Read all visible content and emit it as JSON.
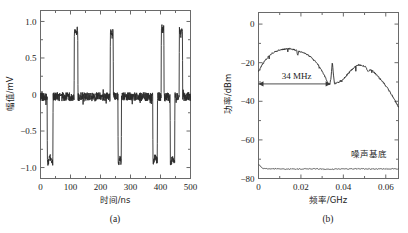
{
  "figure": {
    "background": "#ffffff",
    "trace_color": "#2a2a2a",
    "axis_color": "#6a6a6a"
  },
  "panels": [
    {
      "id": "a",
      "caption": "(a)",
      "xlabel": "时间/ns",
      "ylabel": "幅值/mV",
      "xticks": [
        "0",
        "100",
        "200",
        "300",
        "400",
        "500"
      ],
      "yticks": [
        "1.0",
        "0.5",
        "0",
        "-0.5",
        "-1.0"
      ]
    },
    {
      "id": "b",
      "caption": "(b)",
      "xlabel": "频率/GHz",
      "ylabel": "功率/dBm",
      "xticks": [
        "0",
        "0.02",
        "0.04",
        "0.06"
      ],
      "yticks": [
        "0",
        "-20",
        "-40",
        "-60",
        "-80"
      ],
      "bandwidth_label": "34 MHz",
      "noise_floor_label": "噪声基底"
    }
  ],
  "chart_data": [
    {
      "type": "line",
      "panel": "a",
      "title": "",
      "xlabel": "时间/ns",
      "ylabel": "幅值/mV",
      "xlim": [
        0,
        500
      ],
      "ylim": [
        -1.15,
        1.15
      ],
      "xticks": [
        0,
        100,
        200,
        300,
        400,
        500
      ],
      "yticks": [
        1.0,
        0.5,
        0,
        -0.5,
        -1.0
      ],
      "grid": false,
      "legend": false,
      "description": "Chaotic square-wave-like pulse train of amplitude (mV) versus time (ns). Baseline near 0 mV with small ripple; negative excursions to about -0.95 mV and positive excursions to about +0.88 mV.",
      "baseline_mv": -0.03,
      "baseline_ripple_mv": 0.06,
      "high_level_mv": 0.85,
      "low_level_mv": -0.9,
      "pulses": [
        {
          "start_ns": 22,
          "end_ns": 42,
          "level_mv": -0.9
        },
        {
          "start_ns": 112,
          "end_ns": 125,
          "level_mv": 0.85
        },
        {
          "start_ns": 232,
          "end_ns": 243,
          "level_mv": 0.82
        },
        {
          "start_ns": 258,
          "end_ns": 270,
          "level_mv": -0.9
        },
        {
          "start_ns": 374,
          "end_ns": 390,
          "level_mv": -0.88
        },
        {
          "start_ns": 402,
          "end_ns": 412,
          "level_mv": 0.9
        },
        {
          "start_ns": 432,
          "end_ns": 448,
          "level_mv": -0.9
        },
        {
          "start_ns": 462,
          "end_ns": 474,
          "level_mv": 0.85
        }
      ]
    },
    {
      "type": "line",
      "panel": "b",
      "title": "",
      "xlabel": "频率/GHz",
      "ylabel": "功率/dBm",
      "xlim": [
        0,
        0.066
      ],
      "ylim": [
        -80,
        6
      ],
      "xticks": [
        0,
        0.02,
        0.04,
        0.06
      ],
      "yticks": [
        0,
        -20,
        -40,
        -60,
        -80
      ],
      "grid": false,
      "legend": false,
      "description": "RF power spectrum in dBm versus frequency in GHz. Main lobe peaks near -13 dBm at 0.015 GHz, notch near -31 dBm at 0.034 GHz, secondary lobe peaks near -21 dBm at 0.047 GHz, rolling off to -43 dBm at 0.066 GHz. Flat noise floor near -75 dBm.",
      "annotations": [
        {
          "text": "34 MHz",
          "x_start_ghz": 0.0,
          "x_end_ghz": 0.034,
          "y_dbm": -31
        },
        {
          "text": "噪声基底",
          "x_ghz": 0.052,
          "y_dbm": -69
        }
      ],
      "series": [
        {
          "name": "spectrum",
          "x": [
            0.0,
            0.0015,
            0.003,
            0.0045,
            0.006,
            0.0075,
            0.009,
            0.0105,
            0.012,
            0.0135,
            0.015,
            0.0165,
            0.018,
            0.0185,
            0.019,
            0.0205,
            0.022,
            0.0235,
            0.025,
            0.0265,
            0.028,
            0.0295,
            0.031,
            0.0325,
            0.0335,
            0.0342,
            0.0348,
            0.0352,
            0.0358,
            0.0365,
            0.038,
            0.04,
            0.042,
            0.044,
            0.046,
            0.047,
            0.049,
            0.0505,
            0.0515,
            0.053,
            0.055,
            0.057,
            0.059,
            0.061,
            0.063,
            0.065,
            0.066
          ],
          "y": [
            -24.5,
            -21.5,
            -19.0,
            -17.0,
            -15.5,
            -14.5,
            -13.8,
            -13.2,
            -13.0,
            -12.8,
            -12.8,
            -13.2,
            -13.5,
            -16.5,
            -14.0,
            -14.5,
            -15.2,
            -16.2,
            -17.5,
            -19.0,
            -21.0,
            -23.5,
            -26.5,
            -30.0,
            -31.5,
            -28.0,
            -19.5,
            -25.0,
            -31.0,
            -30.5,
            -30.0,
            -28.5,
            -26.0,
            -23.5,
            -21.8,
            -21.2,
            -21.5,
            -22.0,
            -24.5,
            -23.5,
            -25.5,
            -28.0,
            -30.5,
            -33.5,
            -37.0,
            -41.0,
            -43.0
          ]
        },
        {
          "name": "noise_floor",
          "x": [
            0.0,
            0.002,
            0.008,
            0.016,
            0.024,
            0.032,
            0.04,
            0.048,
            0.056,
            0.064,
            0.066
          ],
          "y": [
            -72.5,
            -74.8,
            -75.0,
            -75.1,
            -75.0,
            -75.2,
            -75.1,
            -75.0,
            -75.1,
            -75.0,
            -75.1
          ]
        }
      ]
    }
  ]
}
